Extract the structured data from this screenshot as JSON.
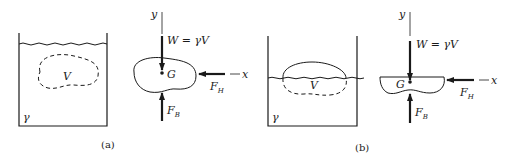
{
  "figure": {
    "panels": [
      {
        "id": "a",
        "caption": "(a)",
        "container": {
          "fluid_label": "γ",
          "volume_label": "V",
          "state": "submerged"
        },
        "free_body": {
          "y_axis_label": "y",
          "x_axis_label": "x",
          "weight_label": "W = γV",
          "centroid_label": "G",
          "horizontal_force": {
            "main": "F",
            "sub": "H"
          },
          "buoyant_force": {
            "main": "F",
            "sub": "B"
          }
        }
      },
      {
        "id": "b",
        "caption": "(b)",
        "container": {
          "fluid_label": "γ",
          "volume_label": "V",
          "state": "floating"
        },
        "free_body": {
          "y_axis_label": "y",
          "x_axis_label": "x",
          "weight_label": "W = γV",
          "centroid_label": "G",
          "horizontal_force": {
            "main": "F",
            "sub": "H"
          },
          "buoyant_force": {
            "main": "F",
            "sub": "B"
          }
        }
      }
    ],
    "colors": {
      "ink": "#1a1a1a",
      "paper": "#ffffff"
    }
  }
}
